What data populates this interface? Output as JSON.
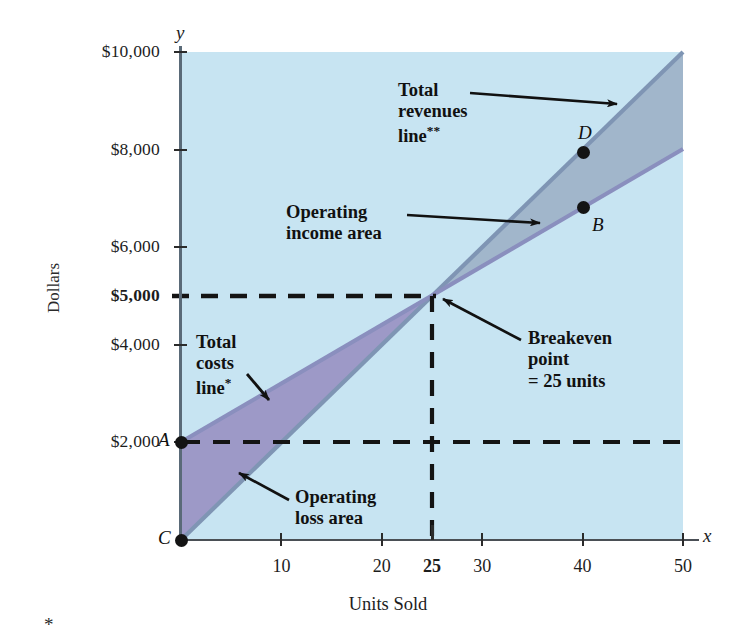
{
  "chart_data": {
    "type": "line",
    "title": "",
    "xlabel": "Units Sold",
    "ylabel": "Dollars",
    "xlim": [
      0,
      50
    ],
    "ylim": [
      0,
      10000
    ],
    "grid": false,
    "legend": "annotations-inline",
    "x_ticks": [
      {
        "value": 10,
        "label": "10",
        "bold": false
      },
      {
        "value": 20,
        "label": "20",
        "bold": false
      },
      {
        "value": 25,
        "label": "25",
        "bold": true
      },
      {
        "value": 30,
        "label": "30",
        "bold": false
      },
      {
        "value": 40,
        "label": "40",
        "bold": false
      },
      {
        "value": 50,
        "label": "50",
        "bold": false
      }
    ],
    "y_ticks": [
      {
        "value": 10000,
        "label": "$10,000",
        "bold": false
      },
      {
        "value": 8000,
        "label": "$8,000",
        "bold": false
      },
      {
        "value": 6000,
        "label": "$6,000",
        "bold": false
      },
      {
        "value": 5000,
        "label": "$5,000",
        "bold": true
      },
      {
        "value": 4000,
        "label": "$4,000",
        "bold": false
      },
      {
        "value": 2000,
        "label": "$2,000",
        "bold": false
      }
    ],
    "series": [
      {
        "name": "Total revenues line",
        "x": [
          0,
          25,
          50
        ],
        "values": [
          0,
          5000,
          10000
        ],
        "slope_per_unit": 200,
        "intercept": 0
      },
      {
        "name": "Total costs line",
        "x": [
          0,
          25,
          50
        ],
        "values": [
          2000,
          5000,
          8000
        ],
        "slope_per_unit": 120,
        "intercept": 2000
      }
    ],
    "points": [
      {
        "id": "A",
        "x": 0,
        "y": 2000,
        "label": "A"
      },
      {
        "id": "B",
        "x": 40,
        "y": 6800,
        "label": "B"
      },
      {
        "id": "C",
        "x": 0,
        "y": 0,
        "label": "C"
      },
      {
        "id": "D",
        "x": 40,
        "y": 8000,
        "label": "D"
      }
    ],
    "regions": [
      {
        "name": "Operating income area",
        "color": "#9fb3c8"
      },
      {
        "name": "Operating loss area",
        "color": "#9a93c4"
      },
      {
        "name": "Background",
        "color": "#c7e4f2"
      }
    ],
    "reference_lines": [
      {
        "name": "breakeven-horizontal",
        "orientation": "horizontal",
        "value": 5000,
        "style": "dashed"
      },
      {
        "name": "breakeven-vertical",
        "orientation": "vertical",
        "value": 25,
        "style": "dashed"
      },
      {
        "name": "fixed-cost-horizontal",
        "orientation": "horizontal",
        "value": 2000,
        "style": "dashed"
      }
    ],
    "breakeven": {
      "units": 25,
      "dollars": 5000
    }
  },
  "axes": {
    "y_letter": "y",
    "x_letter": "x",
    "y_title": "Dollars",
    "x_title": "Units Sold"
  },
  "annotations": {
    "total_revenues": {
      "line1": "Total",
      "line2": "revenues",
      "line3": "line",
      "sup": "**"
    },
    "operating_income": {
      "line1": "Operating",
      "line2": "income area"
    },
    "total_costs": {
      "line1": "Total",
      "line2": "costs",
      "line3": "line",
      "sup": "*"
    },
    "breakeven": {
      "line1": "Breakeven",
      "line2": "point",
      "line3": "= 25 units"
    },
    "operating_loss": {
      "line1": "Operating",
      "line2": "loss area"
    }
  },
  "point_labels": {
    "a": "A",
    "b": "B",
    "c": "C",
    "d": "D"
  },
  "footnote": {
    "marker": "*"
  },
  "colors": {
    "background_fill": "#c7e4f2",
    "income_area": "#9fb3c8",
    "loss_area": "#9a93c4",
    "revenue_line": "#6f85a8",
    "cost_line": "#7e86b5",
    "axis": "#4a4f55",
    "text": "#121212"
  }
}
